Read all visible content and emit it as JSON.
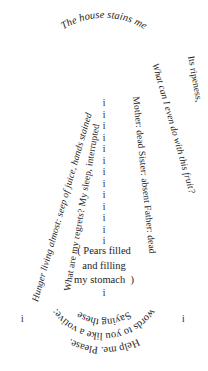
{
  "poem": {
    "title_line": "The house stains me",
    "arc_top": {
      "text": "The house stains me",
      "style": "italic",
      "position": "top-arc"
    },
    "left_lines": [
      {
        "id": "hunger",
        "text": "Hunger living almost: seep of juice, hands stained",
        "style": "italic",
        "orientation": "vertical-up"
      },
      {
        "id": "regrets",
        "text": "What are my regrets? My sleep, interrupted",
        "style": "roman",
        "orientation": "vertical-up"
      }
    ],
    "right_lines": [
      {
        "id": "fruit",
        "text": "What can I even do with this fruit?",
        "style": "italic",
        "orientation": "vertical-down"
      },
      {
        "id": "family",
        "text": "Mother: dead    Sister: absent    Father: dead",
        "style": "roman",
        "orientation": "vertical-down"
      },
      {
        "id": "ripeness",
        "text": "Its ripeness,",
        "style": "roman",
        "orientation": "vertical-down"
      }
    ],
    "center_column": {
      "glyph": "i",
      "count": 13,
      "label": "column-of-i"
    },
    "parenthetical": {
      "lines": [
        "( Pears filled",
        "and filling",
        "my stomach  )"
      ]
    },
    "tail_glyph": "i",
    "flanking_glyphs": {
      "left": "i",
      "right": "i"
    },
    "arc_bottom": [
      {
        "id": "saying",
        "text": "Saying these"
      },
      {
        "id": "votive",
        "text": "words to you like a votive:"
      },
      {
        "id": "help",
        "text": "Help me. Please."
      }
    ]
  },
  "colors": {
    "ink": "#1d1d1d",
    "page": "#ffffff"
  }
}
